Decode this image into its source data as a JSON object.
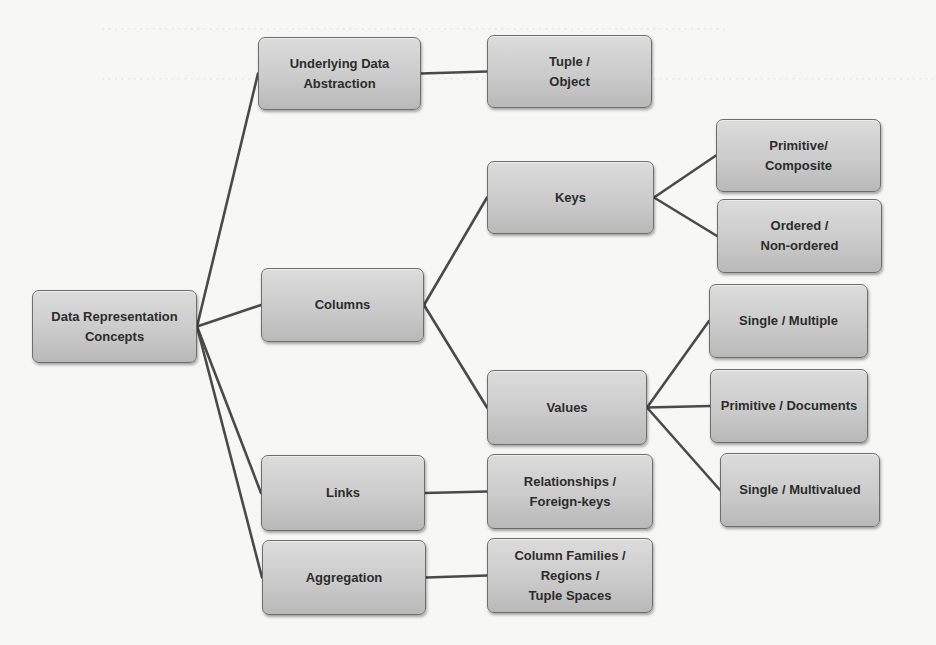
{
  "diagram": {
    "type": "tree",
    "root": "Data Representation Concepts",
    "nodes": [
      {
        "id": "root",
        "label": "Data Representation Concepts",
        "x": 32,
        "y": 290,
        "w": 165,
        "h": 73
      },
      {
        "id": "underlying",
        "label": "Underlying Data\nAbstraction",
        "x": 258,
        "y": 37,
        "w": 163,
        "h": 73
      },
      {
        "id": "columns",
        "label": "Columns",
        "x": 261,
        "y": 268,
        "w": 163,
        "h": 74
      },
      {
        "id": "links",
        "label": "Links",
        "x": 261,
        "y": 455,
        "w": 164,
        "h": 76
      },
      {
        "id": "aggregation",
        "label": "Aggregation",
        "x": 262,
        "y": 540,
        "w": 164,
        "h": 75
      },
      {
        "id": "tuple",
        "label": "Tuple /\nObject",
        "x": 487,
        "y": 35,
        "w": 165,
        "h": 73
      },
      {
        "id": "keys",
        "label": "Keys",
        "x": 487,
        "y": 161,
        "w": 167,
        "h": 73
      },
      {
        "id": "values",
        "label": "Values",
        "x": 487,
        "y": 370,
        "w": 160,
        "h": 75
      },
      {
        "id": "relationships",
        "label": "Relationships /\nForeign-keys",
        "x": 487,
        "y": 454,
        "w": 166,
        "h": 75
      },
      {
        "id": "colfamilies",
        "label": "Column Families /\nRegions /\nTuple Spaces",
        "x": 487,
        "y": 538,
        "w": 166,
        "h": 75
      },
      {
        "id": "primcomp",
        "label": "Primitive/\nComposite",
        "x": 716,
        "y": 119,
        "w": 165,
        "h": 73
      },
      {
        "id": "ordered",
        "label": "Ordered /\nNon-ordered",
        "x": 717,
        "y": 199,
        "w": 165,
        "h": 74
      },
      {
        "id": "singlemulti",
        "label": "Single / Multiple",
        "x": 709,
        "y": 284,
        "w": 159,
        "h": 74
      },
      {
        "id": "primdocs",
        "label": "Primitive / Documents",
        "x": 710,
        "y": 369,
        "w": 158,
        "h": 74
      },
      {
        "id": "singlemultival",
        "label": "Single / Multivalued",
        "x": 720,
        "y": 453,
        "w": 160,
        "h": 74
      }
    ],
    "edges": [
      [
        "root",
        "underlying"
      ],
      [
        "root",
        "columns"
      ],
      [
        "root",
        "links"
      ],
      [
        "root",
        "aggregation"
      ],
      [
        "underlying",
        "tuple"
      ],
      [
        "columns",
        "keys"
      ],
      [
        "columns",
        "values"
      ],
      [
        "links",
        "relationships"
      ],
      [
        "aggregation",
        "colfamilies"
      ],
      [
        "keys",
        "primcomp"
      ],
      [
        "keys",
        "ordered"
      ],
      [
        "values",
        "singlemulti"
      ],
      [
        "values",
        "primdocs"
      ],
      [
        "values",
        "singlemultival"
      ]
    ]
  },
  "colors": {
    "node_fill": "#cbcbcb",
    "node_border": "#6e6e6e",
    "edge": "#4a4a4a",
    "text": "#2c2c2c",
    "background": "#f7f7f5"
  }
}
